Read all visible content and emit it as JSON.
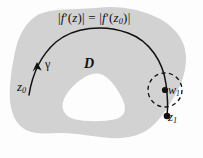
{
  "figure": {
    "type": "complex-analysis-diagram",
    "background_color": "#fdfdfd",
    "region_fill_color": "#d2d2d2",
    "hole_fill_color": "#fbfbfb",
    "ink_color": "#111111"
  },
  "labels": {
    "equation_lhs_abs_open": "|",
    "equation_f": "f",
    "equation_prime": "′",
    "equation_arg_open": "(",
    "equation_z": "z",
    "equation_arg_close": ")",
    "equation_lhs_abs_close": "|",
    "equation_equals": "=",
    "equation_rhs_sub": "0",
    "equation_full": "|f′(z)| = |f′(z₀)|",
    "domain": "D",
    "curve": "γ",
    "point_z0_base": "z",
    "point_z0_sub": "0",
    "point_w1_base": "w",
    "point_w1_sub": "1",
    "point_z1_base": "z",
    "point_z1_sub": "1"
  },
  "geometry": {
    "region_name": "D",
    "region_has_hole": true,
    "curve_name": "γ",
    "curve_start_point": "z0",
    "curve_end_point": "z1",
    "curve_direction": "from z0 upward and over to z1",
    "neighborhood_center": "w1",
    "neighborhood_style": "dashed",
    "neighborhood_radius_px": 17,
    "marked_points": [
      "w1",
      "z1"
    ]
  }
}
